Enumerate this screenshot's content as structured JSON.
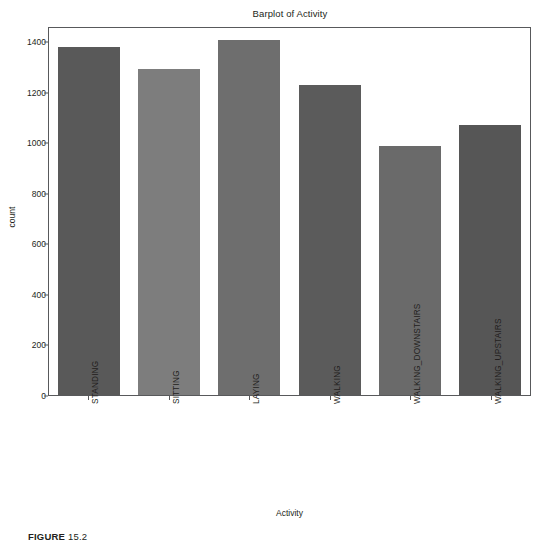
{
  "caption": {
    "label": "FIGURE",
    "number": "15.2"
  },
  "chart_data": {
    "type": "bar",
    "title": "Barplot of Activity",
    "xlabel": "Activity",
    "ylabel": "count",
    "categories": [
      "STANDING",
      "SITTING",
      "LAYING",
      "WALKING",
      "WALKING_DOWNSTAIRS",
      "WALKING_UPSTAIRS"
    ],
    "values": [
      1375,
      1290,
      1405,
      1225,
      985,
      1070
    ],
    "colors": [
      "#595959",
      "#7d7d7d",
      "#6e6e6e",
      "#5b5b5b",
      "#6a6a6a",
      "#565656"
    ],
    "ylim": [
      0,
      1460
    ],
    "yticks": [
      0,
      200,
      400,
      600,
      800,
      1000,
      1200,
      1400
    ],
    "ytick_labels": [
      "0",
      "200",
      "400",
      "600",
      "800",
      "1000",
      "1200",
      "1400"
    ],
    "grid": false,
    "legend": false,
    "background": "#ffffff",
    "frame_color": "#58595b"
  }
}
